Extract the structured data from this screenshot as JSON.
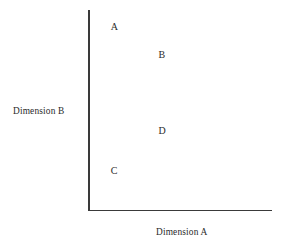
{
  "figure": {
    "width": 286,
    "height": 245,
    "background": "#ffffff",
    "axis_color": "#3a3a3a",
    "text_color": "#2b2b2b"
  },
  "axes": {
    "x_title": "Dimension A",
    "y_title": "Dimension B"
  },
  "chart_data": {
    "type": "scatter",
    "title": "",
    "subtitle": "",
    "xlabel": "Dimension A",
    "ylabel": "Dimension B",
    "xlim": [
      0,
      1
    ],
    "ylim": [
      0,
      1
    ],
    "grid": false,
    "legend": false,
    "legend_position": "none",
    "tick_labels_x": [],
    "tick_labels_y": [],
    "axis_style": "open-L-spines-no-ticks",
    "marker_style": "text-letter-only",
    "points": [
      {
        "label": "A",
        "x": 0.14,
        "y": 0.92
      },
      {
        "label": "B",
        "x": 0.4,
        "y": 0.78
      },
      {
        "label": "D",
        "x": 0.4,
        "y": 0.4
      },
      {
        "label": "C",
        "x": 0.14,
        "y": 0.2
      }
    ],
    "annotations": [
      "A",
      "B",
      "D",
      "C"
    ]
  }
}
